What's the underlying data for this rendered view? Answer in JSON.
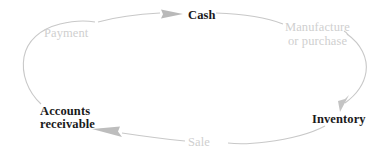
{
  "diagram": {
    "type": "cycle-diagram",
    "colors": {
      "node_text": "#1a1a1a",
      "edge_text": "#cfcfcf",
      "arc_stroke": "#c8c8c8",
      "background": "#ffffff"
    },
    "nodes": [
      {
        "id": "cash",
        "label": "Cash",
        "position": "top"
      },
      {
        "id": "inventory",
        "label": "Inventory",
        "position": "right-bottom"
      },
      {
        "id": "accounts-receivable",
        "label_line_1": "Accounts",
        "label_line_2": "receivable",
        "position": "left-bottom"
      }
    ],
    "edges": [
      {
        "id": "manufacture-or-purchase",
        "label_line_1": "Manufacture",
        "label_line_2": "or purchase",
        "from": "cash",
        "to": "inventory"
      },
      {
        "id": "sale",
        "label": "Sale",
        "from": "inventory",
        "to": "accounts-receivable"
      },
      {
        "id": "payment",
        "label": "Payment",
        "from": "accounts-receivable",
        "to": "cash"
      }
    ]
  }
}
